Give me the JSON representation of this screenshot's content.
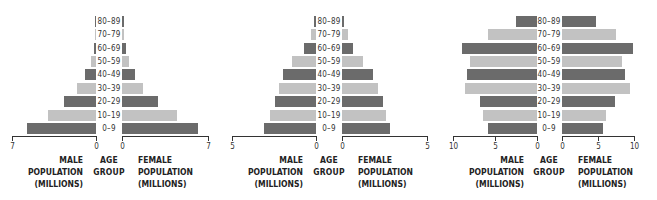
{
  "colors": {
    "dark": "#6b6b6b",
    "light": "#c2c2c2",
    "axis": "#333333"
  },
  "labels": {
    "male": [
      "MALE",
      "POPULATION",
      "(MILLIONS)"
    ],
    "age": [
      "AGE",
      "GROUP"
    ],
    "female": [
      "FEMALE",
      "POPULATION",
      "(MILLIONS)"
    ]
  },
  "chart_data": [
    {
      "type": "bar",
      "subtype": "population-pyramid",
      "categories": [
        "0–9",
        "10–19",
        "20–29",
        "30–39",
        "40–49",
        "50–59",
        "60–69",
        "70–79",
        "80–89"
      ],
      "series": [
        {
          "name": "Male population (millions)",
          "values": [
            5.75,
            4.0,
            2.7,
            1.6,
            0.9,
            0.4,
            0.2,
            0.05,
            0.05
          ]
        },
        {
          "name": "Female population (millions)",
          "values": [
            6.2,
            4.5,
            2.9,
            1.7,
            1.05,
            0.55,
            0.3,
            0.1,
            0.05
          ]
        }
      ],
      "xlabel_left": "MALE POPULATION (MILLIONS)",
      "xlabel_center": "AGE GROUP",
      "xlabel_right": "FEMALE POPULATION (MILLIONS)",
      "xlim": [
        0,
        7
      ],
      "ticks": [
        0,
        7
      ],
      "grid": false
    },
    {
      "type": "bar",
      "subtype": "population-pyramid",
      "categories": [
        "0–9",
        "10–19",
        "20–29",
        "30–39",
        "40–49",
        "50–59",
        "60–69",
        "70–79",
        "80–89"
      ],
      "series": [
        {
          "name": "Male population (millions)",
          "values": [
            3.1,
            2.75,
            2.45,
            2.2,
            1.95,
            1.4,
            0.7,
            0.3,
            0.1
          ]
        },
        {
          "name": "Female population (millions)",
          "values": [
            2.8,
            2.6,
            2.4,
            2.1,
            1.8,
            1.25,
            0.65,
            0.35,
            0.1
          ]
        }
      ],
      "xlabel_left": "MALE POPULATION (MILLIONS)",
      "xlabel_center": "AGE GROUP",
      "xlabel_right": "FEMALE POPULATION (MILLIONS)",
      "xlim": [
        0,
        5
      ],
      "ticks": [
        0,
        5
      ],
      "grid": false
    },
    {
      "type": "bar",
      "subtype": "population-pyramid",
      "categories": [
        "0–9",
        "10–19",
        "20–29",
        "30–39",
        "40–49",
        "50–59",
        "60–69",
        "70–79",
        "80–89"
      ],
      "series": [
        {
          "name": "Male population (millions)",
          "values": [
            5.8,
            6.4,
            6.75,
            8.55,
            8.3,
            7.95,
            8.9,
            5.8,
            2.55
          ]
        },
        {
          "name": "Female population (millions)",
          "values": [
            5.7,
            6.1,
            7.3,
            9.4,
            8.8,
            8.3,
            9.8,
            7.5,
            4.7
          ]
        }
      ],
      "xlabel_left": "MALE POPULATION (MILLIONS)",
      "xlabel_center": "AGE GROUP",
      "xlabel_right": "FEMALE POPULATION (MILLIONS)",
      "xlim": [
        0,
        10
      ],
      "ticks": [
        0,
        5,
        10
      ],
      "grid": false
    }
  ],
  "layout": [
    {
      "left": 0,
      "maleAxisStart": 12,
      "maleZero": 96,
      "femZero": 122,
      "femAxisEnd": 208,
      "max": 7,
      "ageCenter": 109,
      "ticks": [
        0,
        7
      ]
    },
    {
      "left": 0,
      "maleAxisStart": 232,
      "maleZero": 316,
      "femZero": 342,
      "femAxisEnd": 427,
      "max": 5,
      "ageCenter": 329,
      "ticks": [
        0,
        5
      ]
    },
    {
      "left": 0,
      "maleAxisStart": 453,
      "maleZero": 537,
      "femZero": 562,
      "femAxisEnd": 634,
      "max": 10,
      "ageCenter": 549,
      "ticks": [
        0,
        5,
        10
      ]
    }
  ]
}
